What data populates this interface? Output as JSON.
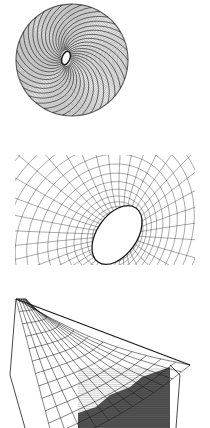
{
  "page": {
    "width": 210,
    "height": 428,
    "background": "#ffffff",
    "ink": "#1a1a1a"
  },
  "figures": [
    {
      "id": "torus-top-view",
      "type": "spiral-torus-wireframe",
      "top": 0,
      "height": 140,
      "center": [
        72,
        60
      ],
      "outer_radius": 56,
      "inner_radius": [
        5,
        8
      ],
      "rings": 44,
      "spokes": 36,
      "twist": 1.4
    },
    {
      "id": "funnel-perspective",
      "type": "funnel-grid-wireframe",
      "top": 140,
      "height": 140,
      "hole_center": [
        117,
        95
      ],
      "hole_radius": [
        20,
        33
      ],
      "hole_tilt": 35,
      "rings": 18,
      "spokes": 40
    },
    {
      "id": "hyperbolic-shell",
      "type": "shell-grid-wireframe",
      "top": 295,
      "height": 133,
      "corners": {
        "top_left": [
          16,
          4
        ],
        "right_tip": [
          190,
          70
        ],
        "bottom_left": [
          25,
          133
        ]
      },
      "grid_u": 12,
      "grid_v": 12,
      "hatched_region_color": "#555555"
    }
  ]
}
